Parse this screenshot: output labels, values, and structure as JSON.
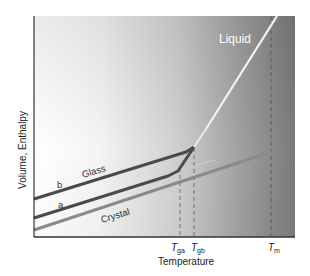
{
  "figure": {
    "y_axis_label": "Volume, Enthalpy",
    "x_axis_label": "Temperature",
    "curve_labels": {
      "liquid": "Liquid",
      "glass": "Glass",
      "crystal": "Crystal",
      "b": "b",
      "a": "a"
    },
    "ticks": {
      "tga_main": "T",
      "tga_sub": "ga",
      "tgb_main": "T",
      "tgb_sub": "gb",
      "tm_main": "T",
      "tm_sub": "m"
    },
    "colors": {
      "glass_line": "#4a4a4a",
      "crystal_line": "#8a8a8a",
      "liquid_line": "#f2f2f2",
      "axis": "#333333",
      "gradient_light": "#ffffff",
      "gradient_dark": "#7a7a7a"
    }
  }
}
